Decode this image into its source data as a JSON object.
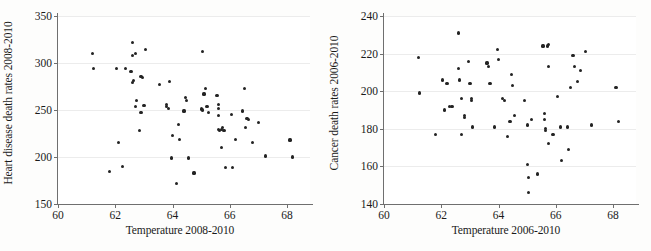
{
  "chart_data": [
    {
      "type": "scatter",
      "title": "",
      "xlabel": "Temperature 2008-2010",
      "ylabel": "Heart disease death rates 2008-2010",
      "xlim": [
        60,
        68.8
      ],
      "ylim": [
        150,
        350
      ],
      "xticks": [
        60,
        62,
        64,
        66,
        68
      ],
      "yticks": [
        150,
        200,
        250,
        300,
        350
      ],
      "grid": "horizontal",
      "legend": "none",
      "marker": "filled-circle",
      "points": [
        [
          61.2,
          310
        ],
        [
          61.25,
          294
        ],
        [
          61.8,
          185
        ],
        [
          62.05,
          294
        ],
        [
          62.1,
          215
        ],
        [
          62.25,
          190
        ],
        [
          62.35,
          294
        ],
        [
          62.6,
          322
        ],
        [
          62.6,
          308
        ],
        [
          62.55,
          291
        ],
        [
          62.6,
          279
        ],
        [
          62.65,
          281
        ],
        [
          62.7,
          310
        ],
        [
          62.7,
          254
        ],
        [
          62.75,
          260
        ],
        [
          62.85,
          228
        ],
        [
          62.9,
          247
        ],
        [
          62.9,
          286
        ],
        [
          62.95,
          285
        ],
        [
          63.0,
          255
        ],
        [
          63.05,
          314
        ],
        [
          63.55,
          277
        ],
        [
          63.8,
          254
        ],
        [
          63.8,
          256
        ],
        [
          63.85,
          252
        ],
        [
          63.9,
          280
        ],
        [
          63.95,
          199
        ],
        [
          64.0,
          223
        ],
        [
          64.15,
          172
        ],
        [
          64.2,
          235
        ],
        [
          64.25,
          219
        ],
        [
          64.4,
          249
        ],
        [
          64.45,
          263
        ],
        [
          64.5,
          260
        ],
        [
          64.55,
          199
        ],
        [
          64.75,
          183
        ],
        [
          65.0,
          251
        ],
        [
          65.05,
          250
        ],
        [
          65.05,
          312
        ],
        [
          65.1,
          267
        ],
        [
          65.15,
          273
        ],
        [
          65.2,
          254
        ],
        [
          65.25,
          247
        ],
        [
          65.55,
          265
        ],
        [
          65.6,
          256
        ],
        [
          65.6,
          252
        ],
        [
          65.6,
          244
        ],
        [
          65.6,
          229
        ],
        [
          65.65,
          228
        ],
        [
          65.7,
          210
        ],
        [
          65.7,
          229
        ],
        [
          65.75,
          231
        ],
        [
          65.8,
          228
        ],
        [
          65.85,
          189
        ],
        [
          66.05,
          245
        ],
        [
          66.1,
          189
        ],
        [
          66.2,
          219
        ],
        [
          66.45,
          249
        ],
        [
          66.5,
          273
        ],
        [
          66.55,
          231
        ],
        [
          66.6,
          241
        ],
        [
          66.65,
          240
        ],
        [
          66.8,
          215
        ],
        [
          67.0,
          237
        ],
        [
          67.25,
          201
        ],
        [
          68.1,
          218
        ],
        [
          68.2,
          200
        ]
      ]
    },
    {
      "type": "scatter",
      "title": "",
      "xlabel": "Temperature 2006-2010",
      "ylabel": "Cancer death rates 2006-2010",
      "xlim": [
        60,
        68.8
      ],
      "ylim": [
        140,
        240
      ],
      "xticks": [
        60,
        62,
        64,
        66,
        68
      ],
      "yticks": [
        140,
        160,
        180,
        200,
        220,
        240
      ],
      "grid": "horizontal",
      "legend": "none",
      "marker": "filled-circle",
      "points": [
        [
          61.2,
          218
        ],
        [
          61.25,
          199
        ],
        [
          61.8,
          177
        ],
        [
          62.05,
          206
        ],
        [
          62.1,
          190
        ],
        [
          62.2,
          204
        ],
        [
          62.3,
          192
        ],
        [
          62.35,
          192
        ],
        [
          62.4,
          192
        ],
        [
          62.6,
          231
        ],
        [
          62.6,
          212
        ],
        [
          62.65,
          206
        ],
        [
          62.7,
          196
        ],
        [
          62.7,
          177
        ],
        [
          62.8,
          187
        ],
        [
          62.8,
          186
        ],
        [
          62.95,
          216
        ],
        [
          63.0,
          204
        ],
        [
          63.05,
          196
        ],
        [
          63.05,
          195
        ],
        [
          63.1,
          181
        ],
        [
          63.6,
          215
        ],
        [
          63.65,
          213
        ],
        [
          63.7,
          204
        ],
        [
          63.85,
          181
        ],
        [
          63.95,
          222
        ],
        [
          64.0,
          217
        ],
        [
          64.15,
          196
        ],
        [
          64.2,
          195
        ],
        [
          64.3,
          176
        ],
        [
          64.4,
          184
        ],
        [
          64.45,
          209
        ],
        [
          64.5,
          203
        ],
        [
          64.55,
          187
        ],
        [
          64.9,
          195
        ],
        [
          65.0,
          161
        ],
        [
          65.0,
          182
        ],
        [
          65.05,
          154
        ],
        [
          65.05,
          146
        ],
        [
          65.15,
          185
        ],
        [
          65.35,
          156
        ],
        [
          65.55,
          224
        ],
        [
          65.6,
          188
        ],
        [
          65.6,
          185
        ],
        [
          65.65,
          180
        ],
        [
          65.65,
          179
        ],
        [
          65.7,
          224
        ],
        [
          65.75,
          225
        ],
        [
          65.75,
          172
        ],
        [
          65.75,
          213
        ],
        [
          65.9,
          177
        ],
        [
          66.05,
          197
        ],
        [
          66.15,
          181
        ],
        [
          66.2,
          163
        ],
        [
          66.4,
          181
        ],
        [
          66.45,
          169
        ],
        [
          66.5,
          202
        ],
        [
          66.6,
          219
        ],
        [
          66.65,
          213
        ],
        [
          66.75,
          205
        ],
        [
          66.85,
          211
        ],
        [
          67.05,
          221
        ],
        [
          67.25,
          182
        ],
        [
          68.1,
          202
        ],
        [
          68.2,
          184
        ]
      ]
    }
  ]
}
